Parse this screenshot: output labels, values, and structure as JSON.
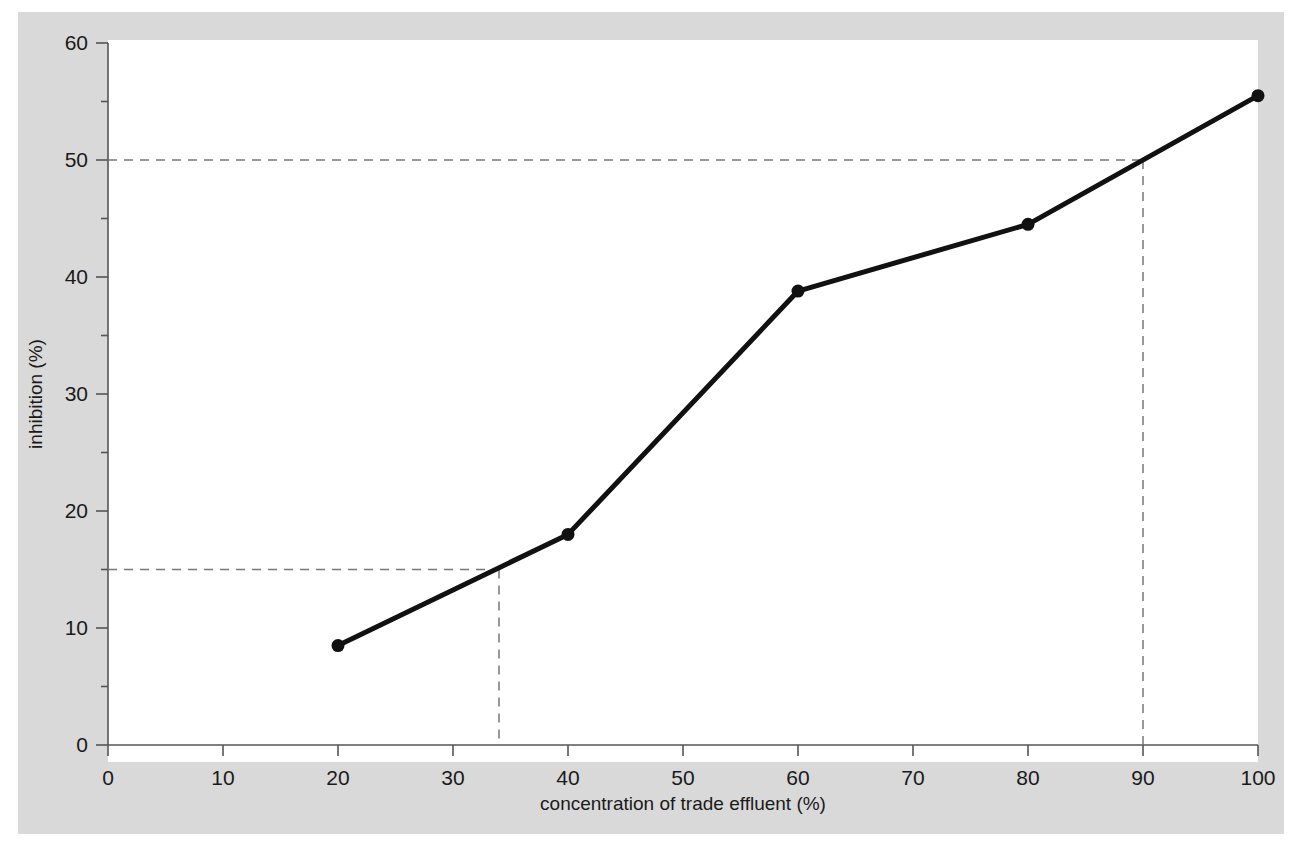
{
  "chart_data": {
    "type": "line",
    "title": "",
    "xlabel": "concentration of trade effluent (%)",
    "ylabel": "inhibition (%)",
    "xlim": [
      0,
      100
    ],
    "ylim": [
      0,
      60
    ],
    "grid": false,
    "legend": null,
    "x": [
      20,
      40,
      60,
      80,
      100
    ],
    "values": [
      8.5,
      18.0,
      38.8,
      44.5,
      55.5
    ],
    "series": [
      {
        "name": "inhibition",
        "x": [
          20,
          40,
          60,
          80,
          100
        ],
        "values": [
          8.5,
          18.0,
          38.8,
          44.5,
          55.5
        ]
      }
    ],
    "xticks": [
      0,
      10,
      20,
      30,
      40,
      50,
      60,
      70,
      80,
      90,
      100
    ],
    "xtick_labels": [
      "0",
      "10",
      "20",
      "30",
      "40",
      "50",
      "60",
      "70",
      "80",
      "90",
      "100"
    ],
    "yticks": [
      0,
      10,
      20,
      30,
      40,
      50,
      60
    ],
    "ytick_labels": [
      "0",
      "10",
      "20",
      "30",
      "40",
      "50",
      "60"
    ],
    "yminor_ticks": [
      5,
      15,
      25,
      35,
      45,
      55
    ],
    "annotations": [
      {
        "name": "ec15-guide",
        "type": "crosshair",
        "y": 15,
        "x": 34,
        "style": "dashed"
      },
      {
        "name": "ec50-guide",
        "type": "crosshair",
        "y": 50,
        "x": 90,
        "style": "dashed"
      }
    ],
    "colors": {
      "figure_background": "#d9d9d9",
      "page_background": "#ffffff",
      "plot_background": "#ffffff",
      "series": "#111111",
      "axis": "#555555",
      "guide": "#777777",
      "text": "#1a1a1a"
    }
  }
}
